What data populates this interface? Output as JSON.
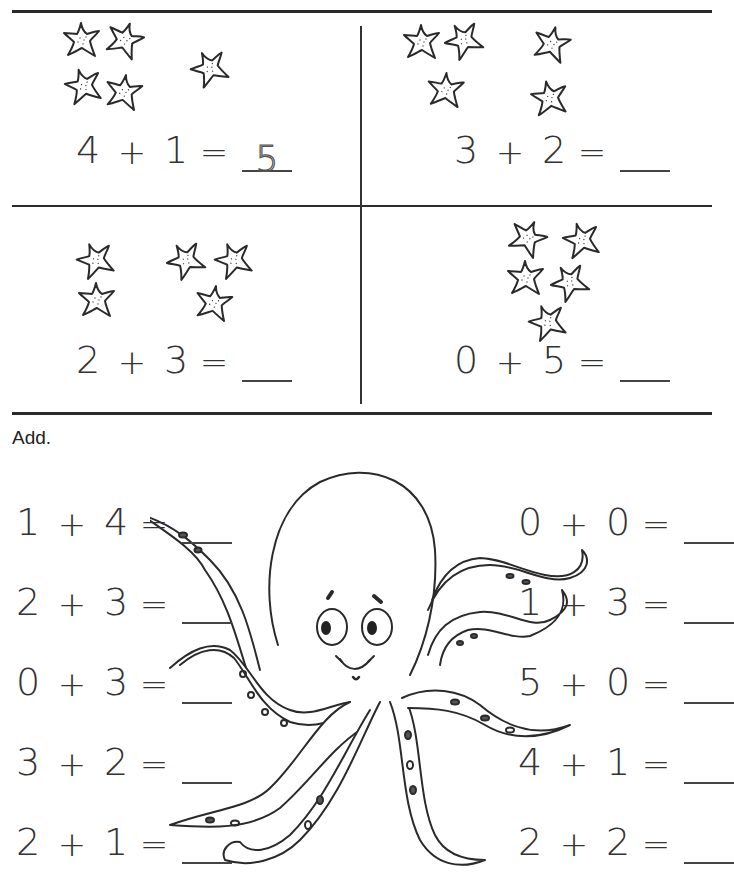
{
  "worksheet": {
    "instruction": "Add.",
    "picture_problems": [
      {
        "id": "q1",
        "a": "4",
        "op": "+",
        "b": "1",
        "eq": "=",
        "answer": "5",
        "answer_style": "dashed-example",
        "stars_group_a": 4,
        "stars_group_b": 1
      },
      {
        "id": "q2",
        "a": "3",
        "op": "+",
        "b": "2",
        "eq": "=",
        "answer": "",
        "stars_group_a": 3,
        "stars_group_b": 2
      },
      {
        "id": "q3",
        "a": "2",
        "op": "+",
        "b": "3",
        "eq": "=",
        "answer": "",
        "stars_group_a": 2,
        "stars_group_b": 3
      },
      {
        "id": "q4",
        "a": "0",
        "op": "+",
        "b": "5",
        "eq": "=",
        "answer": "",
        "stars_group_a": 0,
        "stars_group_b": 5
      }
    ],
    "left_column": [
      {
        "a": "1",
        "op": "+",
        "b": "4",
        "eq": "=",
        "answer": ""
      },
      {
        "a": "2",
        "op": "+",
        "b": "3",
        "eq": "=",
        "answer": ""
      },
      {
        "a": "0",
        "op": "+",
        "b": "3",
        "eq": "=",
        "answer": ""
      },
      {
        "a": "3",
        "op": "+",
        "b": "2",
        "eq": "=",
        "answer": ""
      },
      {
        "a": "2",
        "op": "+",
        "b": "1",
        "eq": "=",
        "answer": ""
      }
    ],
    "right_column": [
      {
        "a": "0",
        "op": "+",
        "b": "0",
        "eq": "=",
        "answer": ""
      },
      {
        "a": "1",
        "op": "+",
        "b": "3",
        "eq": "=",
        "answer": ""
      },
      {
        "a": "5",
        "op": "+",
        "b": "0",
        "eq": "=",
        "answer": ""
      },
      {
        "a": "4",
        "op": "+",
        "b": "1",
        "eq": "=",
        "answer": ""
      },
      {
        "a": "2",
        "op": "+",
        "b": "2",
        "eq": "=",
        "answer": ""
      }
    ],
    "illustrations": {
      "starfish_icon": "starfish-icon",
      "central_image": "octopus-illustration"
    },
    "colors": {
      "ink": "#2a2a2a",
      "paper": "#ffffff",
      "rule": "#2b2b2b"
    }
  }
}
